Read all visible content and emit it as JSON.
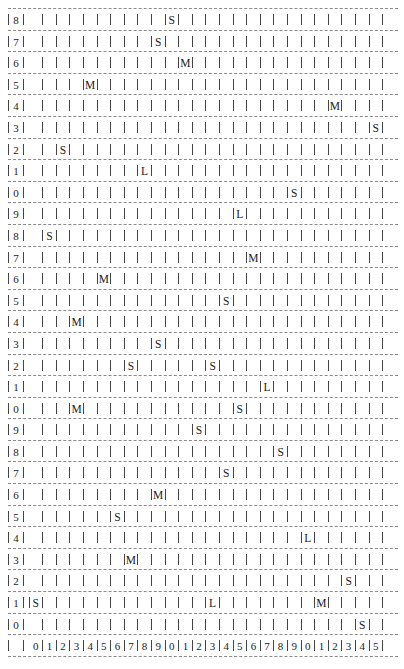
{
  "grid": {
    "columns": 26,
    "rows": 29,
    "row_labels_top_to_bottom": [
      "8",
      "7",
      "6",
      "5",
      "4",
      "3",
      "2",
      "1",
      "0",
      "9",
      "8",
      "7",
      "6",
      "5",
      "4",
      "3",
      "2",
      "1",
      "0",
      "9",
      "8",
      "7",
      "6",
      "5",
      "4",
      "3",
      "2",
      "1",
      "0"
    ],
    "column_labels": [
      "0",
      "1",
      "2",
      "3",
      "4",
      "5",
      "6",
      "7",
      "8",
      "9",
      "0",
      "1",
      "2",
      "3",
      "4",
      "5",
      "6",
      "7",
      "8",
      "9",
      "0",
      "1",
      "2",
      "3",
      "4",
      "5"
    ],
    "markers": [
      {
        "row": 28,
        "col": 10,
        "label": "S"
      },
      {
        "row": 27,
        "col": 9,
        "label": "S"
      },
      {
        "row": 26,
        "col": 11,
        "label": "M"
      },
      {
        "row": 25,
        "col": 4,
        "label": "M"
      },
      {
        "row": 24,
        "col": 22,
        "label": "M"
      },
      {
        "row": 23,
        "col": 25,
        "label": "S"
      },
      {
        "row": 22,
        "col": 2,
        "label": "S"
      },
      {
        "row": 21,
        "col": 8,
        "label": "L"
      },
      {
        "row": 20,
        "col": 19,
        "label": "S"
      },
      {
        "row": 19,
        "col": 15,
        "label": "L"
      },
      {
        "row": 18,
        "col": 1,
        "label": "S"
      },
      {
        "row": 17,
        "col": 16,
        "label": "M"
      },
      {
        "row": 16,
        "col": 5,
        "label": "M"
      },
      {
        "row": 15,
        "col": 14,
        "label": "S"
      },
      {
        "row": 14,
        "col": 3,
        "label": "M"
      },
      {
        "row": 13,
        "col": 9,
        "label": "S"
      },
      {
        "row": 12,
        "col": 7,
        "label": "S"
      },
      {
        "row": 12,
        "col": 13,
        "label": "S"
      },
      {
        "row": 11,
        "col": 17,
        "label": "L"
      },
      {
        "row": 10,
        "col": 3,
        "label": "M"
      },
      {
        "row": 10,
        "col": 15,
        "label": "S"
      },
      {
        "row": 9,
        "col": 12,
        "label": "S"
      },
      {
        "row": 8,
        "col": 18,
        "label": "S"
      },
      {
        "row": 7,
        "col": 14,
        "label": "S"
      },
      {
        "row": 6,
        "col": 9,
        "label": "M"
      },
      {
        "row": 5,
        "col": 6,
        "label": "S"
      },
      {
        "row": 4,
        "col": 20,
        "label": "L"
      },
      {
        "row": 3,
        "col": 7,
        "label": "M"
      },
      {
        "row": 2,
        "col": 23,
        "label": "S"
      },
      {
        "row": 1,
        "col": 0,
        "label": "S"
      },
      {
        "row": 1,
        "col": 13,
        "label": "L"
      },
      {
        "row": 1,
        "col": 21,
        "label": "M"
      },
      {
        "row": 0,
        "col": 24,
        "label": "S"
      }
    ]
  }
}
